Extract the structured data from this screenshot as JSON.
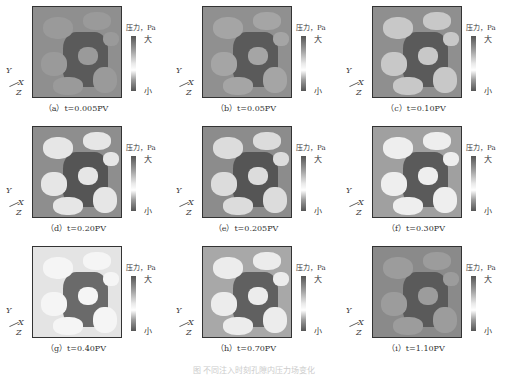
{
  "figure": {
    "legend": {
      "title": "压力，Pa",
      "high": "大",
      "low": "小"
    },
    "axes": {
      "y": "Y",
      "x": "X",
      "z": "Z"
    },
    "panels": [
      {
        "label": "（a）t=0.005PV",
        "bg": "#8f8f8f",
        "dark": "#5a5a5a",
        "light": "#9a9a9a"
      },
      {
        "label": "（b）t=0.05PV",
        "bg": "#909090",
        "dark": "#5a5a5a",
        "light": "#a5a5a5"
      },
      {
        "label": "（c）t=0.10PV",
        "bg": "#8f8f8f",
        "dark": "#5a5a5a",
        "light": "#c8c8c8"
      },
      {
        "label": "（d）t=0.20PV",
        "bg": "#8e8e8e",
        "dark": "#555555",
        "light": "#e6e6e6"
      },
      {
        "label": "（e）t=0.205PV",
        "bg": "#8c8c8c",
        "dark": "#555555",
        "light": "#dcdcdc"
      },
      {
        "label": "（f）t=0.30PV",
        "bg": "#a0a0a0",
        "dark": "#5a5a5a",
        "light": "#eeeeee"
      },
      {
        "label": "（g）t=0.40PV",
        "bg": "#e4e4e4",
        "dark": "#6a6a6a",
        "light": "#f5f5f5"
      },
      {
        "label": "（h）t=0.70PV",
        "bg": "#a8a8a8",
        "dark": "#606060",
        "light": "#ececec"
      },
      {
        "label": "（i）t=1.10PV",
        "bg": "#8a8a8a",
        "dark": "#5a5a5a",
        "light": "#9c9c9c"
      }
    ],
    "caption": "图 不同注入时刻孔隙内压力场变化"
  }
}
